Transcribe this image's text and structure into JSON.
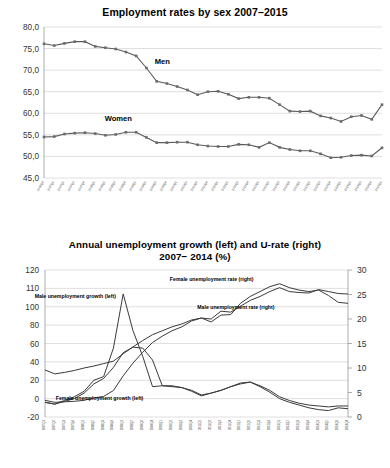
{
  "page": {
    "background": "#ffffff"
  },
  "chart_data": [
    {
      "id": "employment-rates",
      "type": "line",
      "title": "Employment rates by sex 2007–2015",
      "xlabel": "",
      "ylabel": "",
      "ylim": [
        45.0,
        80.0
      ],
      "ytick_labels": [
        "80,0",
        "75,0",
        "70,0",
        "65,0",
        "60,0",
        "55,0",
        "50,0",
        "45,0"
      ],
      "ytick_values": [
        80.0,
        75.0,
        70.0,
        65.0,
        60.0,
        55.0,
        50.0,
        45.0
      ],
      "grid": true,
      "legend_position": "inline-annotations",
      "markers": true,
      "decimal_separator": ",",
      "categories": [
        "2006Q4",
        "2007Q1",
        "2007Q2",
        "2007Q3",
        "2007Q4",
        "2008Q1",
        "2008Q2",
        "2008Q3",
        "2008Q4",
        "2009Q1",
        "2009Q2",
        "2009Q3",
        "2009Q4",
        "2010Q1",
        "2010Q2",
        "2010Q3",
        "2010Q4",
        "2011Q1",
        "2011Q2",
        "2011Q3",
        "2011Q4",
        "2012Q1",
        "2012Q2",
        "2012Q3",
        "2012Q4",
        "2013Q1",
        "2013Q2",
        "2013Q3",
        "2013Q4",
        "2014Q1",
        "2014Q2",
        "2014Q3",
        "2014Q4",
        "2015Q1"
      ],
      "series": [
        {
          "name": "Men",
          "label": "Men",
          "color": "#5a5a5a",
          "values": [
            76.1,
            75.7,
            76.2,
            76.6,
            76.6,
            75.5,
            75.2,
            74.9,
            74.2,
            73.3,
            70.5,
            67.4,
            66.9,
            66.2,
            65.4,
            64.3,
            65.0,
            65.1,
            64.4,
            63.4,
            63.7,
            63.7,
            63.5,
            62.0,
            60.5,
            60.4,
            60.5,
            59.4,
            58.9,
            58.1,
            59.2,
            59.5,
            58.6,
            62.0
          ]
        },
        {
          "name": "Women",
          "label": "Women",
          "color": "#5a5a5a",
          "values": [
            54.5,
            54.6,
            55.2,
            55.4,
            55.5,
            55.3,
            54.9,
            55.1,
            55.6,
            55.6,
            54.4,
            53.2,
            53.2,
            53.3,
            53.3,
            52.7,
            52.4,
            52.3,
            52.3,
            52.8,
            52.7,
            52.1,
            53.2,
            52.1,
            51.6,
            51.3,
            51.3,
            50.6,
            49.7,
            49.8,
            50.2,
            50.3,
            50.1,
            52.0
          ]
        }
      ],
      "annotations": [
        {
          "text": "Men",
          "x_frac": 0.35,
          "y_value": 71.5
        },
        {
          "text": "Women",
          "x_frac": 0.22,
          "y_value": 58.3
        }
      ]
    },
    {
      "id": "unemployment-growth-and-rate",
      "type": "line",
      "title_line1": "Annual unemployment growth (left) and U-rate (right)",
      "title_line2": "2007− 2014 (%)",
      "title": "Annual unemployment growth (left) and U-rate (right) 2007− 2014 (%)",
      "xlabel": "",
      "ylabel_left": "",
      "ylabel_right": "",
      "ylim_left": [
        -20,
        120
      ],
      "ylim_right": [
        0,
        30
      ],
      "ytick_left_labels": [
        "120",
        "110",
        "100",
        "80",
        "60",
        "40",
        "20",
        "0",
        "-20"
      ],
      "ytick_left_values": [
        120,
        110,
        100,
        80,
        60,
        40,
        20,
        0,
        -20
      ],
      "ytick_right_labels": [
        "30",
        "25",
        "20",
        "15",
        "10",
        "5",
        "0"
      ],
      "ytick_right_values": [
        30,
        25,
        20,
        15,
        10,
        5,
        0
      ],
      "grid": true,
      "legend_position": "inline-annotations",
      "markers": false,
      "categories": [
        "2007Q1",
        "2007Q2",
        "2007Q3",
        "2007Q4",
        "2008Q1",
        "2008Q2",
        "2008Q3",
        "2008Q4",
        "2009Q1",
        "2009Q2",
        "2009Q3",
        "2009Q4",
        "2010Q1",
        "2010Q2",
        "2010Q3",
        "2010Q4",
        "2011Q1",
        "2011Q2",
        "2011Q3",
        "2011Q4",
        "2012Q1",
        "2012Q2",
        "2012Q3",
        "2012Q4",
        "2013Q1",
        "2013Q2",
        "2013Q3",
        "2013Q4",
        "2014Q1",
        "2014Q2",
        "2014Q3",
        "2014Q4"
      ],
      "series": [
        {
          "name": "Male unemployment growth (left)",
          "label": "Male unemployment growth (left)",
          "axis": "left",
          "color": "#5a5a5a",
          "values": [
            -4,
            -6,
            -2,
            2,
            8,
            20,
            24,
            55,
            107,
            74,
            46,
            13,
            14,
            14,
            12,
            9,
            4,
            6,
            9,
            13,
            16,
            18,
            14,
            9,
            2,
            -2,
            -5,
            -7,
            -8,
            -9,
            -8,
            -8
          ]
        },
        {
          "name": "Female unemployment growth (left)",
          "label": "Female unemployment growth (left)",
          "axis": "left",
          "color": "#3a3a3a",
          "values": [
            -4,
            -6,
            -3,
            0,
            6,
            16,
            22,
            34,
            50,
            56,
            55,
            42,
            14,
            13,
            12,
            8,
            3,
            6,
            9,
            13,
            17,
            18,
            13,
            7,
            0,
            -4,
            -7,
            -10,
            -12,
            -13,
            -10,
            -11
          ]
        },
        {
          "name": "Male unemployment rate (right)",
          "label": "Male unemployment rate (right)",
          "axis": "right",
          "color": "#3a3a3a",
          "values": [
            3.4,
            3.0,
            3.1,
            3.2,
            3.4,
            3.9,
            4.2,
            5.4,
            8.4,
            11.0,
            13.2,
            15.2,
            16.5,
            17.6,
            18.4,
            19.6,
            20.2,
            19.4,
            20.8,
            20.9,
            23.2,
            24.6,
            25.6,
            26.6,
            27.2,
            26.4,
            25.9,
            25.6,
            25.9,
            24.8,
            23.4,
            23.2
          ]
        },
        {
          "name": "Female unemployment rate (right)",
          "label": "Female unemployment rate (right)",
          "axis": "right",
          "color": "#5a5a5a",
          "values": [
            9.6,
            8.8,
            9.1,
            9.5,
            10.0,
            10.4,
            10.9,
            11.4,
            12.9,
            14.3,
            15.6,
            16.8,
            17.6,
            18.4,
            19.0,
            19.8,
            20.2,
            20.0,
            21.6,
            21.4,
            22.6,
            23.8,
            24.6,
            25.6,
            26.4,
            25.6,
            25.4,
            25.3,
            26.0,
            25.6,
            25.2,
            25.1
          ]
        }
      ],
      "annotations": [
        {
          "text": "Male unemployment growth (left)",
          "x_frac": 0.1,
          "y_value": 105
        },
        {
          "text": "Female unemployment growth (left)",
          "x_frac": 0.18,
          "y_value": -2
        },
        {
          "text": "Female unemployment rate (right)",
          "x_frac": 0.55,
          "y_value": 114
        },
        {
          "text": "Male unemployment rate (right)",
          "x_frac": 0.63,
          "y_value": 98
        }
      ]
    }
  ]
}
